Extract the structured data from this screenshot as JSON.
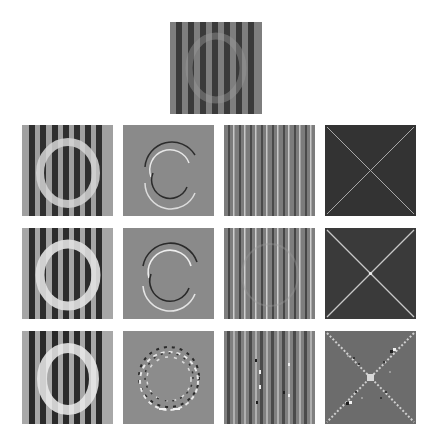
{
  "figure": {
    "background": "#ffffff",
    "top_panel": {
      "name": "original",
      "type": "stripes-with-faint-ring",
      "x": 170,
      "y": 22,
      "size": 92
    },
    "rows": [
      {
        "y": 125,
        "panels": [
          {
            "type": "stripes-with-ring",
            "ring": "bright"
          },
          {
            "type": "ring-edges",
            "style": "thin"
          },
          {
            "type": "fine-stripes"
          },
          {
            "type": "dark-x",
            "bg": "#333333"
          }
        ]
      },
      {
        "y": 228,
        "panels": [
          {
            "type": "stripes-with-ring",
            "ring": "bright"
          },
          {
            "type": "ring-edges",
            "style": "thin"
          },
          {
            "type": "fine-stripes"
          },
          {
            "type": "dark-x",
            "bg": "#3a3a3a"
          }
        ]
      },
      {
        "y": 331,
        "panels": [
          {
            "type": "stripes-with-ring",
            "ring": "bright-blocky"
          },
          {
            "type": "ring-edges",
            "style": "dotted"
          },
          {
            "type": "fine-stripes-noisy"
          },
          {
            "type": "gray-x-dotted",
            "bg": "#6a6a6a"
          }
        ]
      }
    ],
    "column_x": [
      22,
      123,
      224,
      325
    ],
    "colors": {
      "stripe_dark": "#2f2f2f",
      "stripe_light": "#9a9a9a",
      "mid_gray": "#8a8a8a",
      "ring_light": "#d8d8d8",
      "dark_bg": "#333333"
    }
  }
}
